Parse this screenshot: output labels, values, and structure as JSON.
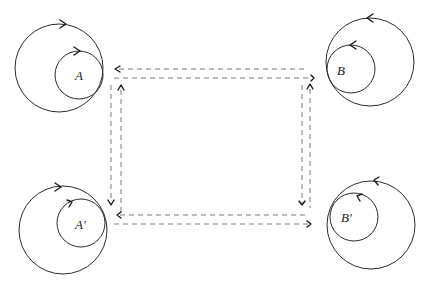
{
  "diagram": {
    "nodes": [
      {
        "id": "A",
        "label": "A",
        "outer": {
          "cx": 59,
          "cy": 68,
          "r": 44
        },
        "inner": {
          "cx": 79,
          "cy": 75,
          "r": 24
        },
        "label_pos": {
          "x": 81,
          "y": 80
        },
        "orientation": "clockwise"
      },
      {
        "id": "B",
        "label": "B",
        "outer": {
          "cx": 370,
          "cy": 62,
          "r": 44
        },
        "inner": {
          "cx": 351,
          "cy": 69,
          "r": 24
        },
        "label_pos": {
          "x": 340,
          "y": 75
        },
        "orientation": "counterclockwise"
      },
      {
        "id": "A'",
        "label": "A′",
        "outer": {
          "cx": 63,
          "cy": 230,
          "r": 44
        },
        "inner": {
          "cx": 81,
          "cy": 223,
          "r": 24
        },
        "label_pos": {
          "x": 76,
          "y": 228
        },
        "orientation": "clockwise"
      },
      {
        "id": "B'",
        "label": "B′",
        "outer": {
          "cx": 371,
          "cy": 225,
          "r": 44
        },
        "inner": {
          "cx": 354,
          "cy": 217,
          "r": 24
        },
        "label_pos": {
          "x": 343,
          "y": 222
        },
        "orientation": "counterclockwise"
      }
    ],
    "edges": [
      {
        "from": "B",
        "to": "A",
        "direction": "left",
        "y": 69
      },
      {
        "from": "A",
        "to": "B",
        "direction": "right",
        "y": 78
      },
      {
        "from": "A",
        "to": "A'",
        "direction": "down",
        "x": 111
      },
      {
        "from": "A'",
        "to": "A",
        "direction": "up",
        "x": 121
      },
      {
        "from": "B",
        "to": "B'",
        "direction": "down",
        "x": 302
      },
      {
        "from": "B'",
        "to": "B",
        "direction": "up",
        "x": 310
      },
      {
        "from": "B'",
        "to": "A'",
        "direction": "left",
        "y": 215
      },
      {
        "from": "A'",
        "to": "B'",
        "direction": "right",
        "y": 224
      }
    ],
    "line_style": "dashed",
    "colors": {
      "stroke": "#2a2a2a",
      "dash": "#7a7a7a",
      "background": "#ffffff"
    }
  }
}
